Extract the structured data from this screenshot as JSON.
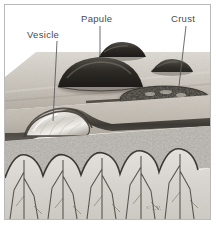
{
  "figure": {
    "signature": "© J.V.",
    "border_color": "#b9b9b9",
    "background": "#ffffff"
  },
  "labels": [
    {
      "id": "vesicle",
      "text": "Vesicle",
      "x": 27,
      "y": 29,
      "leader": {
        "x1": 57,
        "y1": 41,
        "x2": 53,
        "y2": 121
      }
    },
    {
      "id": "papule",
      "text": "Papule",
      "x": 81,
      "y": 13,
      "leader": {
        "x1": 100,
        "y1": 26,
        "x2": 100,
        "y2": 56
      }
    },
    {
      "id": "crust",
      "text": "Crust",
      "x": 171,
      "y": 13,
      "leader": {
        "x1": 186,
        "y1": 26,
        "x2": 179,
        "y2": 86
      }
    }
  ],
  "anatomy": {
    "surface_label": "skin surface",
    "epidermis_label": "epidermis",
    "dermis_label": "dermis",
    "papillae_label": "dermal papillae"
  },
  "colors": {
    "skin_light": "#d9d4cc",
    "skin_mid": "#b4ada3",
    "skin_dark": "#8d857b",
    "lesion_dark": "#2a2722",
    "crust_dark": "#3a352d",
    "vesicle_fluid": "#e8e6e2",
    "dermis_stipple": "#8e8a84",
    "papilla_fill": "#d6d3ce",
    "line": "#4a463f",
    "label": "#4a4a4a"
  }
}
